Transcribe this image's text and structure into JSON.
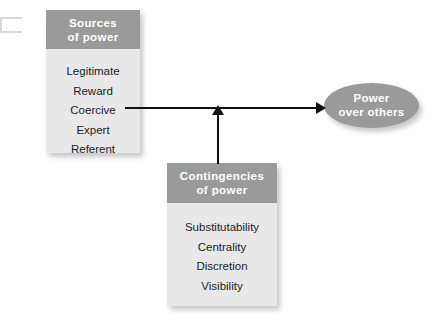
{
  "diagram": {
    "background_color": "#ffffff",
    "header_color": "#9a9a9a",
    "body_color": "#e8e8e8",
    "line_color": "#111111",
    "header_text_color": "#ffffff"
  },
  "sources_box": {
    "header_line1": "Sources",
    "header_line2": "of power",
    "items": [
      {
        "label": "Legitimate"
      },
      {
        "label": "Reward"
      },
      {
        "label": "Coercive"
      },
      {
        "label": "Expert"
      },
      {
        "label": "Referent"
      }
    ]
  },
  "contingencies_box": {
    "header_line1": "Contingencies",
    "header_line2": "of power",
    "items": [
      {
        "label": "Substitutability"
      },
      {
        "label": "Centrality"
      },
      {
        "label": "Discretion"
      },
      {
        "label": "Visibility"
      }
    ]
  },
  "outcome": {
    "line1": "Power",
    "line2": "over others"
  },
  "connectors": [
    {
      "name": "sources-to-power",
      "direction": "right"
    },
    {
      "name": "contingencies-to-link",
      "direction": "up"
    }
  ]
}
